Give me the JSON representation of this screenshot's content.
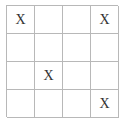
{
  "board": {
    "rows": 4,
    "cols": 4,
    "cells": [
      [
        "X",
        "",
        "",
        "X"
      ],
      [
        "",
        "",
        "",
        ""
      ],
      [
        "",
        "X",
        "",
        ""
      ],
      [
        "",
        "",
        "",
        "X"
      ]
    ]
  }
}
